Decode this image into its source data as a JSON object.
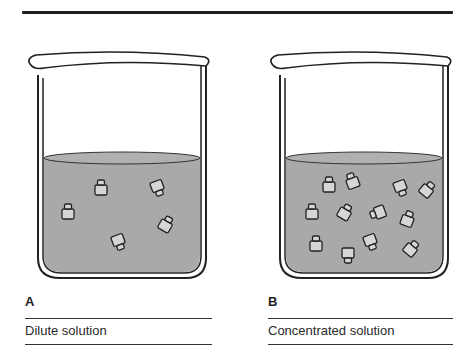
{
  "figure": {
    "panels": [
      {
        "id": "A",
        "letter": "A",
        "caption": "Dilute solution",
        "particle_count": 5
      },
      {
        "id": "B",
        "letter": "B",
        "caption": "Concentrated solution",
        "particle_count": 14
      }
    ],
    "colors": {
      "liquid": "#a9a9a9",
      "outline": "#222222",
      "particle_fill": "#d6d6d6",
      "glass": "#ffffff"
    }
  }
}
